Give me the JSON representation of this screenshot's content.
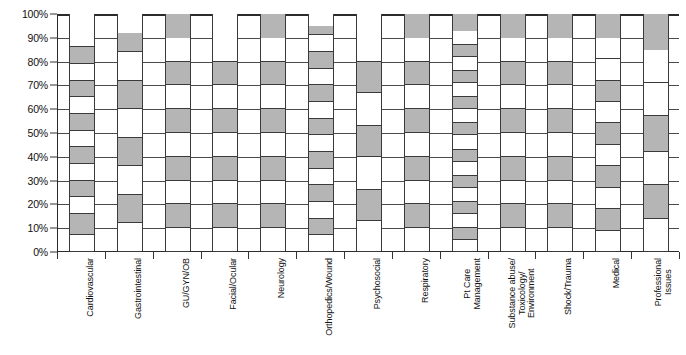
{
  "chart_data": {
    "type": "bar",
    "subtype": "100% stacked bar",
    "title": "",
    "subtitle": "",
    "xlabel": "",
    "ylabel": "",
    "ylim": [
      0,
      100
    ],
    "grid": true,
    "legend": "none",
    "y_ticks": [
      {
        "value": 100,
        "label": "100%"
      },
      {
        "value": 90,
        "label": "90%"
      },
      {
        "value": 80,
        "label": "80%"
      },
      {
        "value": 70,
        "label": "70%"
      },
      {
        "value": 60,
        "label": "60%"
      },
      {
        "value": 50,
        "label": "50%"
      },
      {
        "value": 40,
        "label": "40%"
      },
      {
        "value": 30,
        "label": "30%"
      },
      {
        "value": 20,
        "label": "20%"
      },
      {
        "value": 10,
        "label": "10%"
      },
      {
        "value": 0,
        "label": "0%"
      }
    ],
    "categories": [
      "Cardiovascular",
      "Gastrointestinal",
      "GU/GYN/OB",
      "Facial/Ocular",
      "Neurology",
      "Orthopedics/Wound",
      "Psychosocial",
      "Respiratory",
      "Pt Care Management",
      "Substance abuse/ Toxicology/ Environment",
      "Shock/Trauma",
      "Medical",
      "Professional Issues"
    ],
    "colors": {
      "fill": "#b5b5b5",
      "empty": "#ffffff",
      "outline": "#3a3a3a",
      "axis": "#2b2b2b",
      "gridline": "#4a4a4a",
      "text": "#111111",
      "background": "#ffffff"
    },
    "series": [
      {
        "name": "Cardiovascular",
        "boundaries": [
          0,
          7,
          16,
          23,
          30,
          37,
          44,
          51,
          58,
          65,
          72,
          79,
          86,
          93,
          100
        ],
        "pattern": [
          "empty",
          "fill",
          "empty",
          "fill",
          "empty",
          "fill",
          "empty",
          "fill",
          "empty",
          "fill",
          "empty",
          "fill",
          "empty",
          "empty"
        ]
      },
      {
        "name": "Gastrointestinal",
        "boundaries": [
          0,
          12,
          24,
          36,
          48,
          60,
          72,
          84,
          92,
          100
        ],
        "pattern": [
          "empty",
          "fill",
          "empty",
          "fill",
          "empty",
          "fill",
          "empty",
          "fill",
          "empty"
        ]
      },
      {
        "name": "GU/GYN/OB",
        "boundaries": [
          0,
          10,
          20,
          30,
          40,
          50,
          60,
          70,
          80,
          90,
          100
        ],
        "pattern": [
          "empty",
          "fill",
          "empty",
          "fill",
          "empty",
          "fill",
          "empty",
          "fill",
          "empty",
          "fill"
        ]
      },
      {
        "name": "Facial/Ocular",
        "boundaries": [
          0,
          10,
          20,
          30,
          40,
          50,
          60,
          70,
          80,
          90,
          100
        ],
        "pattern": [
          "empty",
          "fill",
          "empty",
          "fill",
          "empty",
          "fill",
          "empty",
          "fill",
          "empty",
          "empty"
        ]
      },
      {
        "name": "Neurology",
        "boundaries": [
          0,
          10,
          20,
          30,
          40,
          50,
          60,
          70,
          80,
          90,
          100
        ],
        "pattern": [
          "empty",
          "fill",
          "empty",
          "fill",
          "empty",
          "fill",
          "empty",
          "fill",
          "empty",
          "fill"
        ]
      },
      {
        "name": "Orthopedics/Wound",
        "boundaries": [
          0,
          7,
          14,
          21,
          28,
          35,
          42,
          49,
          56,
          63,
          70,
          77,
          84,
          91,
          95,
          100
        ],
        "pattern": [
          "empty",
          "fill",
          "empty",
          "fill",
          "empty",
          "fill",
          "empty",
          "fill",
          "empty",
          "fill",
          "empty",
          "fill",
          "empty",
          "fill",
          "empty"
        ]
      },
      {
        "name": "Psychosocial",
        "boundaries": [
          0,
          13,
          26,
          40,
          53,
          67,
          80,
          93,
          100
        ],
        "pattern": [
          "empty",
          "fill",
          "empty",
          "fill",
          "empty",
          "fill",
          "empty",
          "empty"
        ]
      },
      {
        "name": "Respiratory",
        "boundaries": [
          0,
          10,
          20,
          30,
          40,
          50,
          60,
          70,
          80,
          90,
          100
        ],
        "pattern": [
          "empty",
          "fill",
          "empty",
          "fill",
          "empty",
          "fill",
          "empty",
          "fill",
          "empty",
          "fill"
        ]
      },
      {
        "name": "Pt Care Management",
        "boundaries": [
          0,
          5,
          10,
          16,
          21,
          27,
          32,
          38,
          43,
          49,
          54,
          60,
          65,
          71,
          76,
          82,
          87,
          93,
          100
        ],
        "pattern": [
          "empty",
          "fill",
          "empty",
          "fill",
          "empty",
          "fill",
          "empty",
          "fill",
          "empty",
          "fill",
          "empty",
          "fill",
          "empty",
          "fill",
          "empty",
          "fill",
          "empty",
          "fill"
        ]
      },
      {
        "name": "Substance abuse/ Toxicology/ Environment",
        "boundaries": [
          0,
          10,
          20,
          30,
          40,
          50,
          60,
          70,
          80,
          90,
          100
        ],
        "pattern": [
          "empty",
          "fill",
          "empty",
          "fill",
          "empty",
          "fill",
          "empty",
          "fill",
          "empty",
          "fill"
        ]
      },
      {
        "name": "Shock/Trauma",
        "boundaries": [
          0,
          10,
          20,
          30,
          40,
          50,
          60,
          70,
          80,
          90,
          100
        ],
        "pattern": [
          "empty",
          "fill",
          "empty",
          "fill",
          "empty",
          "fill",
          "empty",
          "fill",
          "empty",
          "fill"
        ]
      },
      {
        "name": "Medical",
        "boundaries": [
          0,
          9,
          18,
          27,
          36,
          45,
          54,
          63,
          72,
          81,
          90,
          100
        ],
        "pattern": [
          "empty",
          "fill",
          "empty",
          "fill",
          "empty",
          "fill",
          "empty",
          "fill",
          "empty",
          "empty",
          "fill"
        ]
      },
      {
        "name": "Professional Issues",
        "boundaries": [
          0,
          14,
          28,
          42,
          57,
          71,
          85,
          100
        ],
        "pattern": [
          "empty",
          "fill",
          "empty",
          "fill",
          "empty",
          "empty",
          "fill"
        ]
      }
    ]
  }
}
